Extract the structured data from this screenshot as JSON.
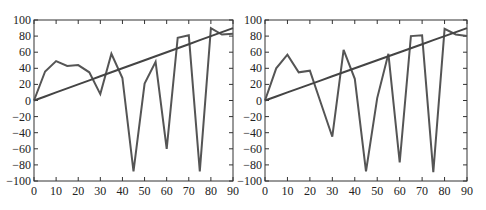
{
  "chart_data": [
    {
      "type": "line",
      "title": "",
      "xlabel": "",
      "ylabel": "",
      "xlim": [
        0,
        90
      ],
      "ylim": [
        -100,
        100
      ],
      "xticks": [
        0,
        10,
        20,
        30,
        40,
        50,
        60,
        70,
        80,
        90
      ],
      "yticks": [
        100,
        80,
        60,
        40,
        20,
        0,
        -20,
        -40,
        -60,
        -80,
        -100
      ],
      "grid": false,
      "legend": null,
      "x": [
        0,
        5,
        10,
        15,
        20,
        25,
        30,
        35,
        40,
        45,
        50,
        55,
        60,
        65,
        70,
        75,
        80,
        85,
        90
      ],
      "series": [
        {
          "name": "signal",
          "color": "#555555",
          "values": [
            0,
            36,
            49,
            43,
            44,
            35,
            8,
            58,
            28,
            -88,
            21,
            48,
            -60,
            78,
            81,
            -88,
            90,
            82,
            83
          ]
        },
        {
          "name": "trend",
          "color": "#444444",
          "values": [
            0,
            5,
            10,
            15,
            20,
            25,
            30,
            35,
            40,
            45,
            50,
            55,
            60,
            65,
            70,
            75,
            80,
            85,
            90
          ]
        }
      ]
    },
    {
      "type": "line",
      "title": "",
      "xlabel": "",
      "ylabel": "",
      "xlim": [
        0,
        90
      ],
      "ylim": [
        -100,
        100
      ],
      "xticks": [
        0,
        10,
        20,
        30,
        40,
        50,
        60,
        70,
        80,
        90
      ],
      "yticks": [
        100,
        80,
        60,
        40,
        20,
        0,
        -20,
        -40,
        -60,
        -80,
        -100
      ],
      "grid": false,
      "legend": null,
      "x": [
        0,
        5,
        10,
        15,
        20,
        25,
        30,
        35,
        40,
        45,
        50,
        55,
        60,
        65,
        70,
        75,
        80,
        85,
        90
      ],
      "series": [
        {
          "name": "signal",
          "color": "#555555",
          "values": [
            0,
            40,
            57,
            35,
            37,
            -4,
            -45,
            63,
            27,
            -88,
            3,
            58,
            -77,
            80,
            81,
            -89,
            89,
            82,
            80
          ]
        },
        {
          "name": "trend",
          "color": "#444444",
          "values": [
            0,
            5,
            10,
            15,
            20,
            25,
            30,
            35,
            40,
            45,
            50,
            55,
            60,
            65,
            70,
            75,
            80,
            85,
            90
          ]
        }
      ]
    }
  ],
  "layout": {
    "plots": [
      {
        "left": 34,
        "right": 233,
        "top": 20,
        "bottom": 181
      },
      {
        "left": 265,
        "right": 467,
        "top": 20,
        "bottom": 181
      }
    ]
  }
}
